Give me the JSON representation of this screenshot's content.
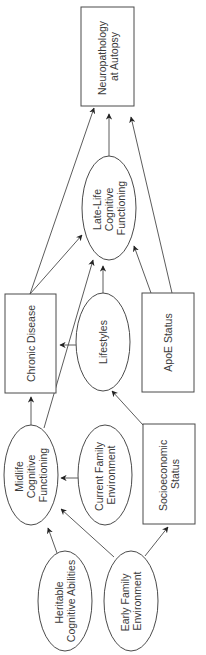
{
  "diagram": {
    "colors": {
      "stroke": "#4a4a4a",
      "text": "#3a3a3a",
      "background": "#ffffff"
    },
    "nodes": {
      "neuropathology": {
        "shape": "rect",
        "lines": [
          "Neuropathology",
          "at Autopsy"
        ]
      },
      "late_life": {
        "shape": "ellipse",
        "lines": [
          "Late-Life",
          "Cognitive",
          "Functioning"
        ]
      },
      "chronic_disease": {
        "shape": "rect",
        "lines": [
          "Chronic Disease"
        ]
      },
      "lifestyles": {
        "shape": "ellipse",
        "lines": [
          "Lifestyles"
        ]
      },
      "apoe": {
        "shape": "rect",
        "lines": [
          "ApoE Status"
        ]
      },
      "midlife": {
        "shape": "ellipse",
        "lines": [
          "Midlife",
          "Cognitive",
          "Functioning"
        ]
      },
      "current_family": {
        "shape": "ellipse",
        "lines": [
          "Current Family",
          "Environment"
        ]
      },
      "socioeconomic": {
        "shape": "rect",
        "lines": [
          "Socioeconomic",
          "Status"
        ]
      },
      "heritable": {
        "shape": "ellipse",
        "lines": [
          "Heritable",
          "Cognitive Abilities"
        ]
      },
      "early_family": {
        "shape": "ellipse",
        "lines": [
          "Early Family",
          "Environment"
        ]
      }
    },
    "edges": [
      {
        "from": "chronic_disease",
        "to": "neuropathology"
      },
      {
        "from": "late_life",
        "to": "neuropathology"
      },
      {
        "from": "apoe",
        "to": "neuropathology"
      },
      {
        "from": "chronic_disease",
        "to": "late_life"
      },
      {
        "from": "midlife",
        "to": "late_life"
      },
      {
        "from": "lifestyles",
        "to": "late_life"
      },
      {
        "from": "apoe",
        "to": "late_life"
      },
      {
        "from": "lifestyles",
        "to": "chronic_disease"
      },
      {
        "from": "midlife",
        "to": "chronic_disease"
      },
      {
        "from": "socioeconomic",
        "to": "lifestyles"
      },
      {
        "from": "current_family",
        "to": "midlife"
      },
      {
        "from": "heritable",
        "to": "midlife"
      },
      {
        "from": "early_family",
        "to": "midlife"
      },
      {
        "from": "early_family",
        "to": "socioeconomic"
      }
    ]
  }
}
